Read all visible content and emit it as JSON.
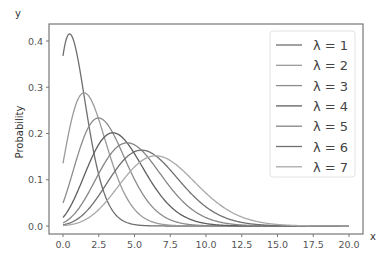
{
  "chart_data": {
    "type": "line",
    "title": "",
    "xlabel": "x",
    "ylabel": "Probability",
    "corner_label_y": "y",
    "xlim": [
      -1.0,
      21.0
    ],
    "ylim": [
      -0.02,
      0.435
    ],
    "xticks": [
      0.0,
      2.5,
      5.0,
      7.5,
      10.0,
      12.5,
      15.0,
      17.5,
      20.0
    ],
    "xtick_labels": [
      "0.0",
      "2.5",
      "5.0",
      "7.5",
      "10.0",
      "12.5",
      "15.0",
      "17.5",
      "20.0"
    ],
    "yticks": [
      0.0,
      0.1,
      0.2,
      0.3,
      0.4
    ],
    "ytick_labels": [
      "0.0",
      "0.1",
      "0.2",
      "0.3",
      "0.4"
    ],
    "grid": false,
    "legend_position": "upper right",
    "function": "continuous Poisson: lambda^x * e^-lambda / Gamma(x+1)",
    "x_range": [
      0,
      20
    ],
    "x": [
      0,
      1,
      2,
      3,
      4,
      5,
      6,
      7,
      8,
      9,
      10,
      12,
      14,
      16,
      18,
      20
    ],
    "series": [
      {
        "name": "λ = 1",
        "lambda": 1,
        "color": "#6e6e6e",
        "peak": {
          "x": 0.46,
          "y": 0.413
        },
        "values": [
          0.368,
          0.368,
          0.184,
          0.061,
          0.015,
          0.003,
          0.001,
          0.0,
          0.0,
          0.0,
          0.0,
          0.0,
          0.0,
          0.0,
          0.0,
          0.0
        ]
      },
      {
        "name": "λ = 2",
        "lambda": 2,
        "color": "#9a9a9a",
        "peak": {
          "x": 1.48,
          "y": 0.287
        },
        "values": [
          0.135,
          0.271,
          0.271,
          0.18,
          0.09,
          0.036,
          0.012,
          0.003,
          0.001,
          0.0,
          0.0,
          0.0,
          0.0,
          0.0,
          0.0,
          0.0
        ]
      },
      {
        "name": "λ = 3",
        "lambda": 3,
        "color": "#8c8c8c",
        "peak": {
          "x": 2.49,
          "y": 0.233
        },
        "values": [
          0.05,
          0.149,
          0.224,
          0.224,
          0.168,
          0.101,
          0.05,
          0.022,
          0.008,
          0.003,
          0.001,
          0.0,
          0.0,
          0.0,
          0.0,
          0.0
        ]
      },
      {
        "name": "λ = 4",
        "lambda": 4,
        "color": "#5f5f5f",
        "peak": {
          "x": 3.49,
          "y": 0.201
        },
        "values": [
          0.018,
          0.073,
          0.147,
          0.195,
          0.195,
          0.156,
          0.104,
          0.06,
          0.03,
          0.013,
          0.005,
          0.001,
          0.0,
          0.0,
          0.0,
          0.0
        ]
      },
      {
        "name": "λ = 5",
        "lambda": 5,
        "color": "#858585",
        "peak": {
          "x": 4.49,
          "y": 0.18
        },
        "values": [
          0.007,
          0.034,
          0.084,
          0.14,
          0.175,
          0.175,
          0.146,
          0.104,
          0.065,
          0.036,
          0.018,
          0.003,
          0.0,
          0.0,
          0.0,
          0.0
        ]
      },
      {
        "name": "λ = 6",
        "lambda": 6,
        "color": "#707070",
        "peak": {
          "x": 5.49,
          "y": 0.164
        },
        "values": [
          0.002,
          0.015,
          0.045,
          0.089,
          0.134,
          0.161,
          0.161,
          0.138,
          0.103,
          0.069,
          0.041,
          0.011,
          0.002,
          0.0,
          0.0,
          0.0
        ]
      },
      {
        "name": "λ = 7",
        "lambda": 7,
        "color": "#a8a8a8",
        "peak": {
          "x": 6.49,
          "y": 0.152
        },
        "values": [
          0.001,
          0.006,
          0.022,
          0.052,
          0.091,
          0.128,
          0.149,
          0.149,
          0.13,
          0.101,
          0.071,
          0.026,
          0.007,
          0.001,
          0.0,
          0.0
        ]
      }
    ]
  }
}
